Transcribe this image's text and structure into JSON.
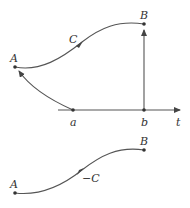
{
  "diagram": {
    "top": {
      "points": {
        "A": "A",
        "B": "B"
      },
      "curve_label": "C",
      "axis": {
        "a": "a",
        "b": "b",
        "t": "t"
      }
    },
    "bottom": {
      "points": {
        "A": "A",
        "B": "B"
      },
      "curve_label": "−C"
    }
  },
  "colors": {
    "stroke": "#555555",
    "text": "#333333",
    "background": "#ffffff"
  }
}
